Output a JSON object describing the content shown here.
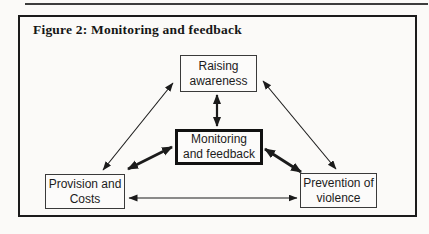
{
  "figure": {
    "title": "Figure 2: Monitoring and feedback"
  },
  "diagram": {
    "nodes": [
      {
        "id": "raising-awareness",
        "line1": "Raising",
        "line2": "awareness",
        "emphasized": false
      },
      {
        "id": "monitoring-feedback",
        "line1": "Monitoring",
        "line2": "and feedback",
        "emphasized": true
      },
      {
        "id": "provision-costs",
        "line1": "Provision and",
        "line2": "Costs",
        "emphasized": false
      },
      {
        "id": "prevention-violence",
        "line1": "Prevention of",
        "line2": "violence",
        "emphasized": false
      }
    ],
    "edges": [
      {
        "from": "raising-awareness",
        "to": "provision-costs",
        "style": "thin",
        "bidirectional": true
      },
      {
        "from": "raising-awareness",
        "to": "prevention-violence",
        "style": "thin",
        "bidirectional": true
      },
      {
        "from": "monitoring-feedback",
        "to": "raising-awareness",
        "style": "medium",
        "bidirectional": true
      },
      {
        "from": "monitoring-feedback",
        "to": "provision-costs",
        "style": "bold",
        "bidirectional": true
      },
      {
        "from": "monitoring-feedback",
        "to": "prevention-violence",
        "style": "bold",
        "bidirectional": true
      },
      {
        "from": "provision-costs",
        "to": "prevention-violence",
        "style": "thin",
        "bidirectional": true
      }
    ],
    "colors": {
      "ink": "#1b1b1b",
      "paper": "#fbfaf8"
    }
  }
}
